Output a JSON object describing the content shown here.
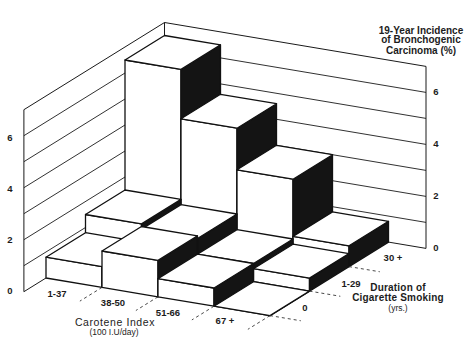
{
  "chart_data": {
    "type": "bar",
    "three_d": true,
    "title": "19-Year Incidence of Bronchogenic Carcinoma (%)",
    "title_lines": [
      "19-Year Incidence",
      "of Bronchogenic",
      "Carcinoma (%)"
    ],
    "xlabel": "Carotene Index (100 I.U/day)",
    "xlabel_lines": [
      "Carotene Index",
      "(100 I.U/day)"
    ],
    "depth_label": "Duration of Cigarette Smoking (yrs.)",
    "depth_label_lines": [
      "Duration of",
      "Cigarette Smoking",
      "(yrs.)"
    ],
    "ylabel": "19-Year Incidence of Bronchogenic Carcinoma (%)",
    "categories": [
      "1-37",
      "38-50",
      "51-66",
      "67 +"
    ],
    "depth_categories": [
      "0",
      "1-29",
      "30 +"
    ],
    "series": [
      {
        "name": "0",
        "values": [
          0.8,
          1.4,
          0.7,
          0.0
        ]
      },
      {
        "name": "1-29",
        "values": [
          1.5,
          1.3,
          0.7,
          0.5
        ]
      },
      {
        "name": "30 +",
        "values": [
          6.5,
          4.6,
          3.0,
          0.8
        ]
      }
    ],
    "ylim": [
      0,
      7
    ],
    "yticks": [
      0,
      2,
      4,
      6
    ],
    "grid": true,
    "legend": null,
    "colors": {
      "face": "#ffffff",
      "side": "#141414",
      "line": "#111111"
    }
  }
}
